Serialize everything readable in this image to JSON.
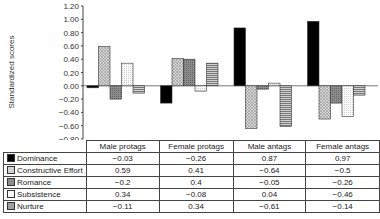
{
  "chart_data": {
    "type": "bar",
    "title": "",
    "xlabel": "",
    "ylabel": "Standardized scores",
    "ylim": [
      -0.8,
      1.2
    ],
    "yticks": [
      "1.20",
      "1.00",
      "0.80",
      "0.60",
      "0.40",
      "0.20",
      "0.00",
      "−0.20",
      "−0.40",
      "−0.60",
      "−0.80"
    ],
    "categories": [
      "Male protags",
      "Female protags",
      "Male antags",
      "Female antags"
    ],
    "series": [
      {
        "name": "Dominance",
        "values": [
          -0.03,
          -0.26,
          0.87,
          0.97
        ],
        "fill": "#000000",
        "pattern": "solid"
      },
      {
        "name": "Constructive Effort",
        "values": [
          0.59,
          0.41,
          -0.64,
          -0.5
        ],
        "fill": "#c8c8c8",
        "pattern": "crosshatch"
      },
      {
        "name": "Romance",
        "values": [
          -0.2,
          0.4,
          -0.05,
          -0.26
        ],
        "fill": "#8a8a8a",
        "pattern": "dark-dotted"
      },
      {
        "name": "Subsistence",
        "values": [
          0.34,
          -0.08,
          0.04,
          -0.46
        ],
        "fill": "#f4f4f4",
        "pattern": "light-dotted"
      },
      {
        "name": "Nurture",
        "values": [
          -0.11,
          0.34,
          -0.61,
          -0.14
        ],
        "fill": "#b0b0b0",
        "pattern": "horizontal-lines"
      }
    ],
    "grid": false,
    "legend_position": "data-table"
  },
  "table": {
    "headers": [
      "Male protags",
      "Female protags",
      "Male antags",
      "Female antags"
    ],
    "rows": [
      {
        "label": "Dominance",
        "values": [
          "−0.03",
          "−0.26",
          "0.87",
          "0.97"
        ]
      },
      {
        "label": "Constructive Effort",
        "values": [
          "0.59",
          "0.41",
          "−0.64",
          "−0.5"
        ]
      },
      {
        "label": "Romance",
        "values": [
          "−0.2",
          "0.4",
          "−0.05",
          "−0.26"
        ]
      },
      {
        "label": "Subsistence",
        "values": [
          "0.34",
          "−0.08",
          "0.04",
          "−0.46"
        ]
      },
      {
        "label": "Nurture",
        "values": [
          "−0.11",
          "0.34",
          "−0.61",
          "−0.14"
        ]
      }
    ]
  }
}
